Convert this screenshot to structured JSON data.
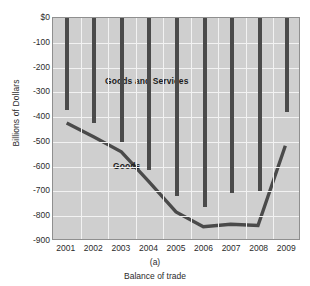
{
  "figure": {
    "top_clipped_text": "",
    "panel_letter": "(a)",
    "caption": "Balance of trade"
  },
  "chart_data": {
    "type": "bar",
    "title": "",
    "xlabel": "Balance of trade",
    "ylabel": "Billions of Dollars",
    "categories": [
      "2001",
      "2002",
      "2003",
      "2004",
      "2005",
      "2006",
      "2007",
      "2008",
      "2009"
    ],
    "ylim": [
      -900,
      0
    ],
    "ytick_labels": [
      "$0",
      "-100",
      "-200",
      "-300",
      "-400",
      "-500",
      "-600",
      "-700",
      "-800",
      "-900"
    ],
    "ytick_values": [
      0,
      -100,
      -200,
      -300,
      -400,
      -500,
      -600,
      -700,
      -800,
      -900
    ],
    "grid": true,
    "legend_position": "inline-annotation",
    "series": [
      {
        "name": "Goods and Services",
        "render": "bar",
        "color": "#4a4a4a",
        "values": [
          -370,
          -425,
          -500,
          -615,
          -718,
          -762,
          -705,
          -700,
          -380
        ]
      },
      {
        "name": "Goods",
        "render": "line",
        "color": "#4a4a4a",
        "values": [
          -428,
          -485,
          -545,
          -665,
          -790,
          -850,
          -840,
          -845,
          -520
        ]
      }
    ],
    "annotations": [
      {
        "text": "Goods and Services",
        "x": "2003",
        "y": -255
      },
      {
        "text": "Goods",
        "x": "2002",
        "y": -748
      }
    ],
    "plot_background": "#cfcfcf",
    "grid_color": "#f2f2f2"
  }
}
